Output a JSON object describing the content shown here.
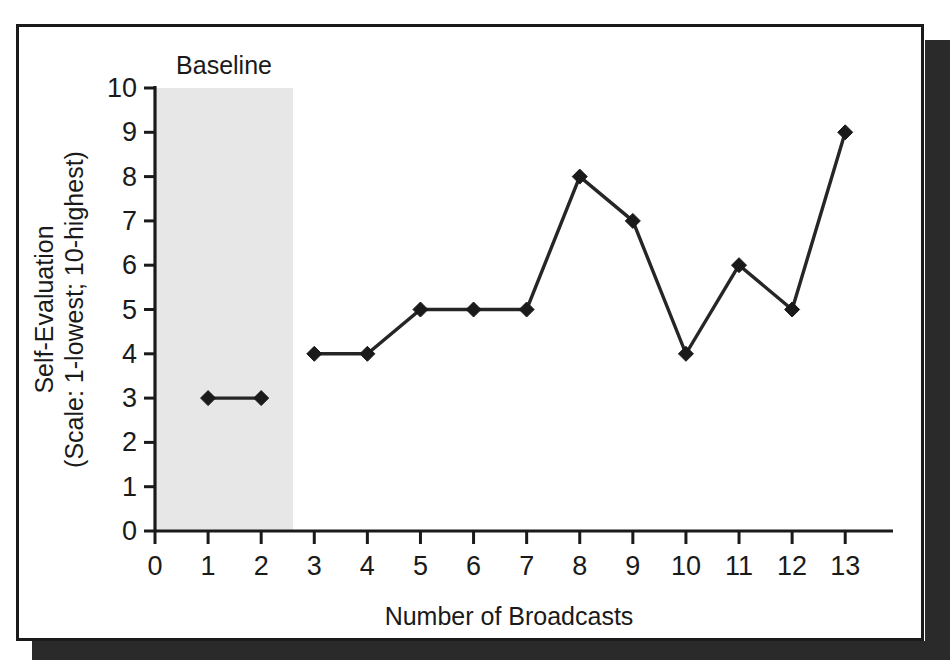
{
  "chart_data": {
    "type": "line",
    "title": "",
    "xlabel": "Number of Broadcasts",
    "ylabel_line1": "Self-Evaluation",
    "ylabel_line2": "(Scale: 1-lowest; 10-highest)",
    "xlim": [
      0,
      13.9
    ],
    "ylim": [
      0,
      10
    ],
    "x_ticks": [
      0,
      1,
      2,
      3,
      4,
      5,
      6,
      7,
      8,
      9,
      10,
      11,
      12,
      13
    ],
    "y_ticks": [
      0,
      1,
      2,
      3,
      4,
      5,
      6,
      7,
      8,
      9,
      10
    ],
    "x_tick_labels": [
      "0",
      "1",
      "2",
      "3",
      "4",
      "5",
      "6",
      "7",
      "8",
      "9",
      "10",
      "11",
      "12",
      "13"
    ],
    "y_tick_labels": [
      "0",
      "1",
      "2",
      "3",
      "4",
      "5",
      "6",
      "7",
      "8",
      "9",
      "10"
    ],
    "grid": false,
    "legend": "none",
    "marker": "diamond",
    "line_color": "#262626",
    "marker_color": "#1a1a1a",
    "series": [
      {
        "name": "Baseline",
        "x": [
          1,
          2
        ],
        "values": [
          3,
          3
        ]
      },
      {
        "name": "Intervention",
        "x": [
          3,
          4,
          5,
          6,
          7,
          8,
          9,
          10,
          11,
          12,
          13
        ],
        "values": [
          4,
          4,
          5,
          5,
          5,
          8,
          7,
          4,
          6,
          5,
          9
        ]
      }
    ],
    "annotations": [
      {
        "text": "Baseline",
        "x_center": 1.3,
        "type": "phase-label"
      }
    ],
    "shaded_regions": [
      {
        "label": "Baseline",
        "x_start": 0,
        "x_end": 2.6,
        "y_start": 0,
        "y_end": 10,
        "color": "#e7e7e7"
      }
    ]
  },
  "figure": {
    "background_color": "#ffffff",
    "frame_color": "#1a1a1a",
    "shadow_color": "#2a2a2a"
  }
}
